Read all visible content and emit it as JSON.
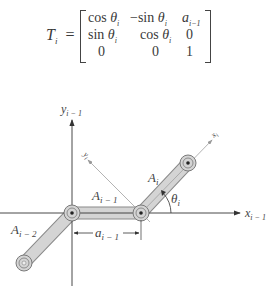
{
  "equation": {
    "lhs": "T",
    "lhs_sub": "i",
    "equals": "=",
    "matrix": [
      [
        {
          "pre": "cos ",
          "var": "θ",
          "sub": "i"
        },
        {
          "pre": "−sin ",
          "var": "θ",
          "sub": "i"
        },
        {
          "pre": "",
          "var": "a",
          "sub": "i−1"
        }
      ],
      [
        {
          "pre": "sin ",
          "var": "θ",
          "sub": "i"
        },
        {
          "pre": "cos ",
          "var": "θ",
          "sub": "i"
        },
        {
          "pre": "0",
          "var": "",
          "sub": ""
        }
      ],
      [
        {
          "pre": "0",
          "var": "",
          "sub": ""
        },
        {
          "pre": "0",
          "var": "",
          "sub": ""
        },
        {
          "pre": "1",
          "var": "",
          "sub": ""
        }
      ]
    ]
  },
  "diagram": {
    "axis_labels": {
      "y_prev": "y",
      "y_prev_sub": "i − 1",
      "x_prev": "x",
      "x_prev_sub": "i − 1",
      "x_i": "x",
      "x_i_sub": "i",
      "y_i": "y",
      "y_i_sub": "i"
    },
    "link_labels": {
      "a_i_minus_2": "A",
      "a_i_minus_2_sub": "i − 2",
      "a_i_minus_1": "A",
      "a_i_minus_1_sub": "i − 1",
      "a_i": "A",
      "a_i_sub": "i"
    },
    "dimension_label": "a",
    "dimension_label_sub": "i − 1",
    "angle_label": "θ",
    "angle_label_sub": "i",
    "colors": {
      "link_fill": "#d4d4d4",
      "link_stroke": "#8a8a8a",
      "axis": "#333333",
      "frame_axis": "#9a9a9a"
    }
  }
}
